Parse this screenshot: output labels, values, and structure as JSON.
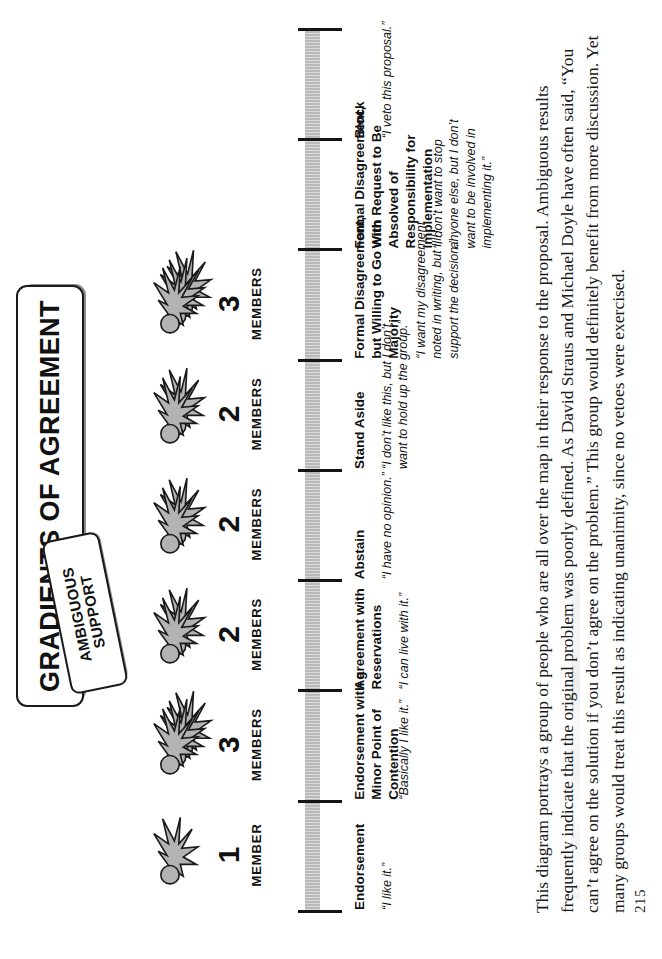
{
  "page": {
    "folio": "215",
    "orientation": "rotated-90-ccw"
  },
  "title_banner": {
    "text": "GRADIENTS OF AGREEMENT"
  },
  "sub_banner": {
    "line1": "AMBIGUOUS",
    "line2": "SUPPORT"
  },
  "colors": {
    "axis_bar": "#b9b9b9",
    "tick": "#141414",
    "banner_shadow": "#8c8c8c",
    "icon_fill": "#b3b3b3",
    "icon_stroke": "#1a1a1a",
    "text": "#111111",
    "paper": "#ffffff"
  },
  "chart_data": {
    "type": "bar",
    "title": "GRADIENTS OF AGREEMENT",
    "xlabel": "",
    "ylabel": "MEMBERS",
    "categories": [
      "Endorsement",
      "Endorsement with a Minor Point of Contention",
      "Agreement with Reservations",
      "Abstain",
      "Stand Aside",
      "Formal Disagreement, but Willing to Go with Majority",
      "Formal Disagreement, With Request to Be Absolved of Responsibility for Implementation",
      "Block"
    ],
    "values": [
      1,
      3,
      2,
      2,
      2,
      3,
      0,
      0
    ],
    "ylim": [
      0,
      3
    ],
    "grid": false,
    "legend": null,
    "annotations": [
      "“I like it.”",
      "“Basically I like it.”",
      "“I can live with it.”",
      "“I have no opinion.”",
      "“I don’t like this, but I don’t want to hold up the group.”",
      "“I want my disagreement noted in writing, but I’ll support the decision.”",
      "“I don’t want to stop anyone else, but I don’t want to be involved in implementing it.”",
      "“I veto this proposal.”"
    ]
  },
  "levels": [
    {
      "label": "Endorsement",
      "quote": "“I like it.”",
      "count": "1",
      "unit": "MEMBER",
      "heads": 1
    },
    {
      "label": "Endorsement with a Minor Point of Contention",
      "quote": "“Basically I like it.”",
      "count": "3",
      "unit": "MEMBERS",
      "heads": 3
    },
    {
      "label": "Agreement with Reservations",
      "quote": "“I can live with it.”",
      "count": "2",
      "unit": "MEMBERS",
      "heads": 2
    },
    {
      "label": "Abstain",
      "quote": "“I have no opinion.”",
      "count": "2",
      "unit": "MEMBERS",
      "heads": 2
    },
    {
      "label": "Stand Aside",
      "quote": "“I don’t like this, but I don’t want to hold up the group.”",
      "count": "2",
      "unit": "MEMBERS",
      "heads": 2
    },
    {
      "label": "Formal Disagreement, but Willing to Go with Majority",
      "quote": "“I want my disagreement noted in writing, but I’ll support the decision.”",
      "count": "3",
      "unit": "MEMBERS",
      "heads": 3
    },
    {
      "label": "Formal Disagreement, With Request to Be Absolved of Responsibility for Implementation",
      "quote": "“I don’t want to stop anyone else, but I don’t want to be involved in implementing it.”",
      "count": "",
      "unit": "",
      "heads": 0
    },
    {
      "label": "Block",
      "quote": "“I veto this proposal.”",
      "count": "",
      "unit": "",
      "heads": 0
    }
  ],
  "body": {
    "paragraph": "This diagram portrays a group of people who are all over the map in their response to the proposal. Ambiguous results frequently indicate that the original problem was poorly defined.  As David Straus and Michael Doyle have often said, “You can’t agree on the solution if you don’t agree on the problem.”  This group would definitely benefit from more discussion.  Yet many groups would treat this result as indicating unanimity, since no vetoes were exercised."
  }
}
